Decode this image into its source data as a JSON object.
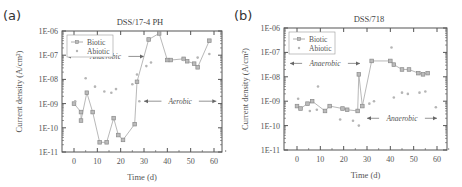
{
  "chart_data": [
    {
      "type": "scatter",
      "panel_label": "(a)",
      "title": "DSS/17-4 PH",
      "xlabel": "Time (d)",
      "ylabel": "Current density (A/cm²)",
      "yscale": "log",
      "xlim": [
        -5,
        65
      ],
      "ylim": [
        1e-11,
        1e-06
      ],
      "xticks": [
        "0",
        "10",
        "20",
        "30",
        "40",
        "50",
        "60"
      ],
      "yticks": [
        "1E-11",
        "1E-10",
        "1E-09",
        "1E-08",
        "1E-07",
        "1E-06"
      ],
      "legend": [
        "Biotic",
        "Abiotic"
      ],
      "legend_position": "upper left",
      "annotations": [
        {
          "text": "Anaerobic",
          "x_range": [
            -3,
            30
          ],
          "log_y": -7.05
        },
        {
          "text": "Aerobic",
          "x_range": [
            30,
            61
          ],
          "log_y": -8.9
        }
      ],
      "series": [
        {
          "name": "Biotic",
          "style": "line+square",
          "log_points": [
            [
              0,
              -9.0
            ],
            [
              3,
              -9.35
            ],
            [
              3,
              -9.7
            ],
            [
              5.5,
              -8.55
            ],
            [
              8,
              -9.35
            ],
            [
              11,
              -10.6
            ],
            [
              14,
              -10.6
            ],
            [
              17,
              -9.6
            ],
            [
              19,
              -10.3
            ],
            [
              21,
              -10.5
            ],
            [
              26,
              -9.85
            ],
            [
              27,
              -8.1
            ],
            [
              32,
              -6.35
            ],
            [
              36.5,
              -6.1
            ],
            [
              40,
              -7.2
            ],
            [
              41.5,
              -7.2
            ],
            [
              47,
              -7.15
            ],
            [
              48.5,
              -7.25
            ],
            [
              51.5,
              -7.35
            ],
            [
              53,
              -7.5
            ],
            [
              58,
              -6.4
            ]
          ]
        },
        {
          "name": "Abiotic",
          "style": "dot",
          "log_points": [
            [
              0.5,
              -8.9
            ],
            [
              5,
              -7.95
            ],
            [
              9,
              -8.3
            ],
            [
              13,
              -8.5
            ],
            [
              16,
              -8.55
            ],
            [
              18,
              -8.4
            ],
            [
              25,
              -8.2
            ],
            [
              27,
              -7.8
            ],
            [
              28,
              -8.9
            ],
            [
              31,
              -7.45
            ],
            [
              33,
              -7.3
            ],
            [
              40,
              -7.2
            ],
            [
              47,
              -7.2
            ],
            [
              53,
              -7.1
            ],
            [
              58,
              -6.95
            ]
          ]
        }
      ]
    },
    {
      "type": "scatter",
      "panel_label": "(b)",
      "title": "DSS/718",
      "xlabel": "Time (d)",
      "ylabel": "Current density (A/cm²)",
      "yscale": "log",
      "xlim": [
        -5,
        65
      ],
      "ylim": [
        1e-11,
        1e-06
      ],
      "xticks": [
        "0",
        "10",
        "20",
        "30",
        "40",
        "50",
        "60"
      ],
      "yticks": [
        "1E-11",
        "1E-10",
        "1E-09",
        "1E-08",
        "1E-07",
        "1E-06"
      ],
      "legend": [
        "Biotic",
        "Abiotic"
      ],
      "legend_position": "upper left",
      "annotations": [
        {
          "text": "Anaerobic",
          "x_range": [
            -3,
            27
          ],
          "log_y": -7.45
        },
        {
          "text": "Anaerobic",
          "x_range": [
            30,
            60
          ],
          "log_y": -9.7
        }
      ],
      "series": [
        {
          "name": "Biotic",
          "style": "line+square",
          "log_points": [
            [
              0,
              -9.2
            ],
            [
              1.5,
              -9.3
            ],
            [
              4.5,
              -9.1
            ],
            [
              6.5,
              -9.0
            ],
            [
              12,
              -9.4
            ],
            [
              14,
              -9.2
            ],
            [
              19.5,
              -9.3
            ],
            [
              21.5,
              -9.35
            ],
            [
              26,
              -9.4
            ],
            [
              26.5,
              -7.9
            ],
            [
              28,
              -9.2
            ],
            [
              32,
              -7.35
            ],
            [
              40,
              -7.35
            ],
            [
              41.5,
              -7.5
            ],
            [
              45,
              -7.7
            ],
            [
              48,
              -7.7
            ],
            [
              52,
              -7.85
            ],
            [
              54,
              -7.9
            ],
            [
              56,
              -7.85
            ]
          ]
        },
        {
          "name": "Abiotic",
          "style": "dot",
          "log_points": [
            [
              0.5,
              -8.9
            ],
            [
              5.5,
              -9.4
            ],
            [
              8.5,
              -9.35
            ],
            [
              9,
              -8.4
            ],
            [
              18.5,
              -9.75
            ],
            [
              24,
              -9.8
            ],
            [
              26.5,
              -10.0
            ],
            [
              31,
              -9.1
            ],
            [
              33,
              -9.0
            ],
            [
              40.5,
              -6.8
            ],
            [
              41.5,
              -8.85
            ],
            [
              45,
              -8.65
            ],
            [
              47.5,
              -8.7
            ],
            [
              52.5,
              -8.65
            ],
            [
              55,
              -8.6
            ],
            [
              59.5,
              -9.25
            ]
          ]
        }
      ]
    }
  ],
  "colors": {
    "biotic": "#8a8a8a",
    "abiotic": "#b5b5b5",
    "axis": "#555555"
  }
}
